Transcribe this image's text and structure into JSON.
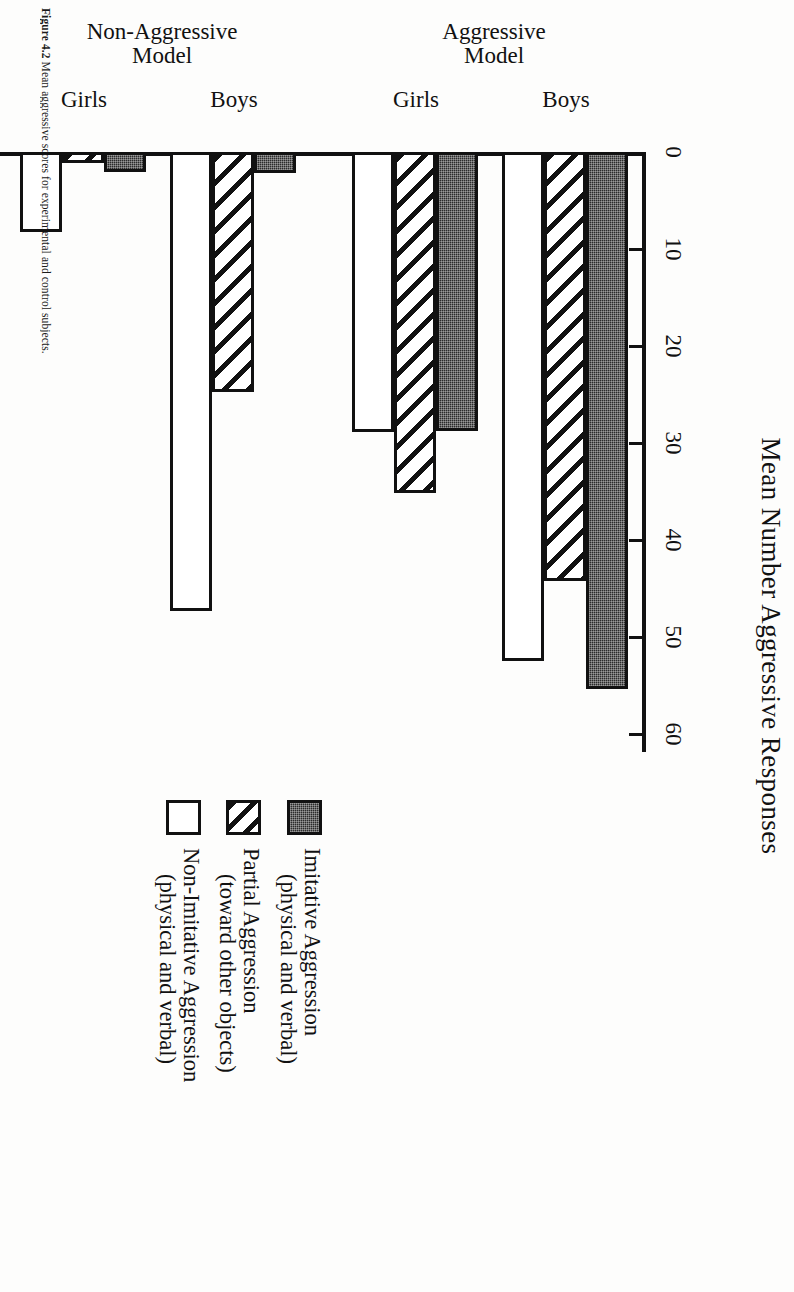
{
  "figure": {
    "caption_label": "Figure 4.2",
    "caption_text": "Mean aggressive scores for experimental and control subjects."
  },
  "chart_data": {
    "type": "bar",
    "orientation": "horizontal",
    "title": "Mean Number Aggressive Responses",
    "xlabel": "Mean Number Aggressive Responses",
    "ylabel": "",
    "xlim": [
      0,
      60
    ],
    "xticks": [
      0,
      10,
      20,
      30,
      40,
      50,
      60
    ],
    "xticklabels": [
      "0",
      "10",
      "20",
      "30",
      "40",
      "50",
      "60"
    ],
    "grid": false,
    "legend_position": "right",
    "series": [
      {
        "name": "Imitative Aggression (physical and verbal)",
        "fill": "solid",
        "values": [
          55.4,
          28.8,
          2.2,
          2.1,
          2.3,
          0.5
        ]
      },
      {
        "name": "Partial Aggression (toward other objects)",
        "fill": "hatch",
        "values": [
          44.2,
          35.2,
          24.7,
          1.1,
          11.9,
          11.9
        ]
      },
      {
        "name": "Non-Imitative Aggression (physical and verbal)",
        "fill": "open",
        "values": [
          52.5,
          28.9,
          47.3,
          8.2,
          23.4,
          4.6
        ]
      }
    ],
    "categories": [
      "Boys",
      "Girls",
      "Boys",
      "Girls",
      "Boys",
      "Girls"
    ],
    "groups": [
      {
        "label": "Aggressive Model",
        "label_lines": [
          "Aggressive",
          "Model"
        ],
        "members": [
          0,
          1
        ]
      },
      {
        "label": "Non-Aggressive Model",
        "label_lines": [
          "Non-Aggressive",
          "Model"
        ],
        "members": [
          2,
          3
        ]
      },
      {
        "label": "No Model",
        "label_lines": [
          "No",
          "Model"
        ],
        "members": [
          4,
          5
        ]
      }
    ]
  },
  "legend": {
    "items": [
      {
        "swatch": "solid",
        "line1": "Imitative Aggression",
        "line2": "(physical and verbal)"
      },
      {
        "swatch": "hatch",
        "line1": "Partial Aggression",
        "line2": "(toward other objects)"
      },
      {
        "swatch": "open",
        "line1": "Non-Imitative Aggression",
        "line2": "(physical and verbal)"
      }
    ]
  },
  "colors": {
    "ink": "#111111",
    "paper": "#fdfdfc",
    "solid_fill": "#2b2b2b"
  }
}
